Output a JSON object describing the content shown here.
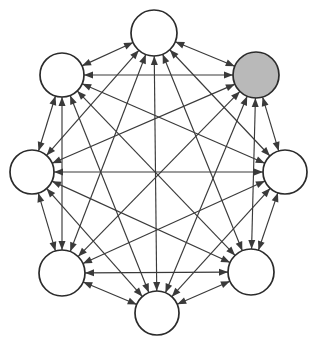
{
  "diagram": {
    "type": "complete-graph",
    "node_count": 8,
    "edge_style": "double-headed-arrow",
    "background_color": "#ffffff",
    "line_color": "#3a3a3a",
    "node_stroke_color": "#2b2b2b",
    "node_fill_plain": "#ffffff",
    "node_fill_shaded": "#b9b9b9",
    "node_radius": 22,
    "arrow_length": 9,
    "arrow_width": 7,
    "nodes": [
      {
        "id": "n0",
        "label": "",
        "cx": 154,
        "cy": 33,
        "r": 23,
        "fill": "plain",
        "position": "top"
      },
      {
        "id": "n1",
        "label": "",
        "cx": 256,
        "cy": 75,
        "r": 23,
        "fill": "shaded",
        "position": "top-right"
      },
      {
        "id": "n2",
        "label": "",
        "cx": 285,
        "cy": 172,
        "r": 22,
        "fill": "plain",
        "position": "right"
      },
      {
        "id": "n3",
        "label": "",
        "cx": 251,
        "cy": 272,
        "r": 23,
        "fill": "plain",
        "position": "bottom-right"
      },
      {
        "id": "n4",
        "label": "",
        "cx": 157,
        "cy": 313,
        "r": 22,
        "fill": "plain",
        "position": "bottom"
      },
      {
        "id": "n5",
        "label": "",
        "cx": 62,
        "cy": 273,
        "r": 23,
        "fill": "plain",
        "position": "bottom-left"
      },
      {
        "id": "n6",
        "label": "",
        "cx": 32,
        "cy": 172,
        "r": 22,
        "fill": "plain",
        "position": "left"
      },
      {
        "id": "n7",
        "label": "",
        "cx": 62,
        "cy": 75,
        "r": 22,
        "fill": "plain",
        "position": "top-left"
      }
    ],
    "edges": [
      {
        "from": "n0",
        "to": "n1",
        "bidirectional": true
      },
      {
        "from": "n0",
        "to": "n2",
        "bidirectional": true
      },
      {
        "from": "n0",
        "to": "n3",
        "bidirectional": true
      },
      {
        "from": "n0",
        "to": "n4",
        "bidirectional": true
      },
      {
        "from": "n0",
        "to": "n5",
        "bidirectional": true
      },
      {
        "from": "n0",
        "to": "n6",
        "bidirectional": true
      },
      {
        "from": "n0",
        "to": "n7",
        "bidirectional": true
      },
      {
        "from": "n1",
        "to": "n2",
        "bidirectional": true
      },
      {
        "from": "n1",
        "to": "n3",
        "bidirectional": true
      },
      {
        "from": "n1",
        "to": "n4",
        "bidirectional": true
      },
      {
        "from": "n1",
        "to": "n5",
        "bidirectional": true
      },
      {
        "from": "n1",
        "to": "n6",
        "bidirectional": true
      },
      {
        "from": "n1",
        "to": "n7",
        "bidirectional": true
      },
      {
        "from": "n2",
        "to": "n3",
        "bidirectional": true
      },
      {
        "from": "n2",
        "to": "n4",
        "bidirectional": true
      },
      {
        "from": "n2",
        "to": "n5",
        "bidirectional": true
      },
      {
        "from": "n2",
        "to": "n6",
        "bidirectional": true
      },
      {
        "from": "n2",
        "to": "n7",
        "bidirectional": true
      },
      {
        "from": "n3",
        "to": "n4",
        "bidirectional": true
      },
      {
        "from": "n3",
        "to": "n5",
        "bidirectional": true
      },
      {
        "from": "n3",
        "to": "n6",
        "bidirectional": true
      },
      {
        "from": "n3",
        "to": "n7",
        "bidirectional": true
      },
      {
        "from": "n4",
        "to": "n5",
        "bidirectional": true
      },
      {
        "from": "n4",
        "to": "n6",
        "bidirectional": true
      },
      {
        "from": "n4",
        "to": "n7",
        "bidirectional": true
      },
      {
        "from": "n5",
        "to": "n6",
        "bidirectional": true
      },
      {
        "from": "n5",
        "to": "n7",
        "bidirectional": true
      },
      {
        "from": "n6",
        "to": "n7",
        "bidirectional": true
      }
    ]
  }
}
